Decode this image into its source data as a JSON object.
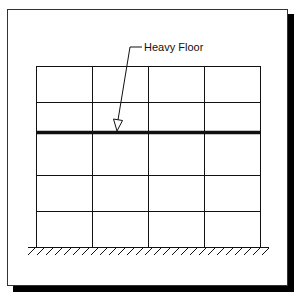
{
  "diagram": {
    "type": "structural-frame-elevation",
    "label": "Heavy Floor",
    "frame": {
      "bays": 4,
      "stories": 5,
      "heavy_floor_level": 3,
      "column_x": [
        36,
        92,
        148,
        204,
        260
      ],
      "floor_y": [
        66,
        102,
        132,
        175,
        211,
        247
      ],
      "heavy_floor_y": 132
    },
    "colors": {
      "line": "#111111",
      "shadow": "#000000",
      "background": "#ffffff"
    },
    "ground": {
      "y": 247,
      "x_start": 28,
      "x_end": 269,
      "hatch_spacing": 9
    }
  }
}
